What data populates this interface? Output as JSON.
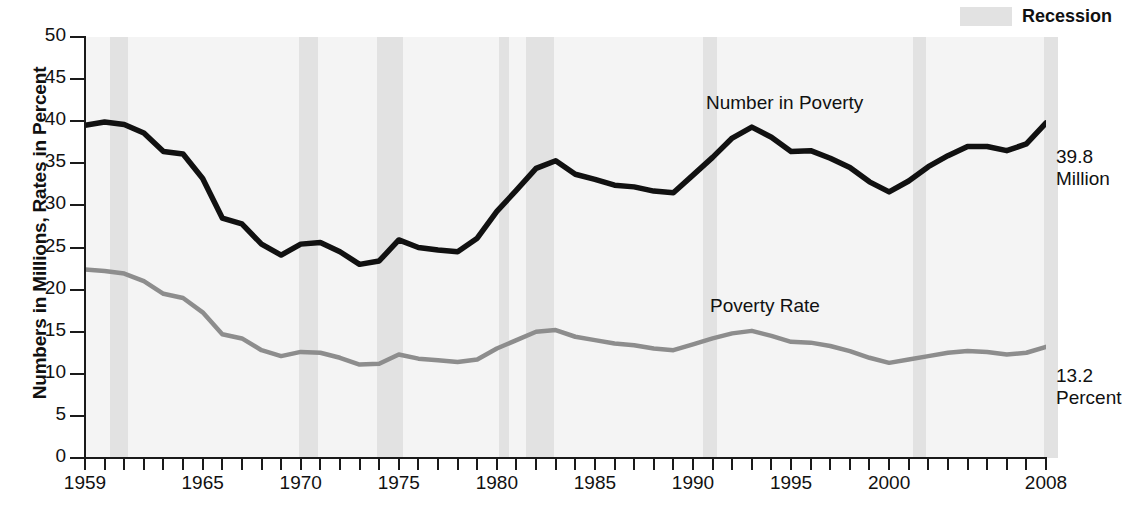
{
  "axis": {
    "y_title": "Numbers in Millions, Rates in Percent",
    "y_ticks": [
      "0",
      "5",
      "10",
      "15",
      "20",
      "25",
      "30",
      "35",
      "40",
      "45",
      "50"
    ],
    "x_ticks": [
      "1959",
      "1965",
      "1970",
      "1975",
      "1980",
      "1985",
      "1990",
      "1995",
      "2000",
      "2008"
    ]
  },
  "legend": {
    "recession_label": "Recession",
    "recession_color": "#e2e2e2"
  },
  "annotations": {
    "number_series_label": "Number in Poverty",
    "rate_series_label": "Poverty Rate",
    "number_end_value": "39.8",
    "number_end_unit": "Million",
    "rate_end_value": "13.2",
    "rate_end_unit": "Percent"
  },
  "colors": {
    "number_line": "#111111",
    "rate_line": "#8d8d8d",
    "plot_background": "#f4f4f4",
    "recession_band": "#e2e2e2",
    "axis": "#1a1a1a"
  },
  "chart_data": {
    "type": "line",
    "title": "",
    "xlabel": "",
    "ylabel": "Numbers in Millions, Rates in Percent",
    "xlim": [
      1959,
      2008
    ],
    "ylim": [
      0,
      50
    ],
    "ytick_step": 5,
    "grid": false,
    "legend_position": "top-right",
    "x": [
      1959,
      1960,
      1961,
      1962,
      1963,
      1964,
      1965,
      1966,
      1967,
      1968,
      1969,
      1970,
      1971,
      1972,
      1973,
      1974,
      1975,
      1976,
      1977,
      1978,
      1979,
      1980,
      1981,
      1982,
      1983,
      1984,
      1985,
      1986,
      1987,
      1988,
      1989,
      1990,
      1991,
      1992,
      1993,
      1994,
      1995,
      1996,
      1997,
      1998,
      1999,
      2000,
      2001,
      2002,
      2003,
      2004,
      2005,
      2006,
      2007,
      2008
    ],
    "series": [
      {
        "name": "Number in Poverty",
        "unit": "millions",
        "color": "#111111",
        "end_value": 39.8,
        "values": [
          39.5,
          39.9,
          39.6,
          38.6,
          36.4,
          36.1,
          33.2,
          28.5,
          27.8,
          25.4,
          24.1,
          25.4,
          25.6,
          24.5,
          23.0,
          23.4,
          25.9,
          25.0,
          24.7,
          24.5,
          26.1,
          29.3,
          31.8,
          34.4,
          35.3,
          33.7,
          33.1,
          32.4,
          32.2,
          31.7,
          31.5,
          33.6,
          35.7,
          38.0,
          39.3,
          38.1,
          36.4,
          36.5,
          35.6,
          34.5,
          32.8,
          31.6,
          32.9,
          34.6,
          35.9,
          37.0,
          37.0,
          36.5,
          37.3,
          39.8
        ]
      },
      {
        "name": "Poverty Rate",
        "unit": "percent",
        "color": "#8d8d8d",
        "end_value": 13.2,
        "values": [
          22.4,
          22.2,
          21.9,
          21.0,
          19.5,
          19.0,
          17.3,
          14.7,
          14.2,
          12.8,
          12.1,
          12.6,
          12.5,
          11.9,
          11.1,
          11.2,
          12.3,
          11.8,
          11.6,
          11.4,
          11.7,
          13.0,
          14.0,
          15.0,
          15.2,
          14.4,
          14.0,
          13.6,
          13.4,
          13.0,
          12.8,
          13.5,
          14.2,
          14.8,
          15.1,
          14.5,
          13.8,
          13.7,
          13.3,
          12.7,
          11.9,
          11.3,
          11.7,
          12.1,
          12.5,
          12.7,
          12.6,
          12.3,
          12.5,
          13.2
        ]
      }
    ],
    "recessions": [
      {
        "start": 1960.3,
        "end": 1961.2
      },
      {
        "start": 1969.9,
        "end": 1970.9
      },
      {
        "start": 1973.9,
        "end": 1975.2
      },
      {
        "start": 1980.1,
        "end": 1980.6
      },
      {
        "start": 1981.5,
        "end": 1982.9
      },
      {
        "start": 1990.5,
        "end": 1991.2
      },
      {
        "start": 2001.2,
        "end": 2001.9
      },
      {
        "start": 2007.9,
        "end": 2008.6
      }
    ]
  }
}
